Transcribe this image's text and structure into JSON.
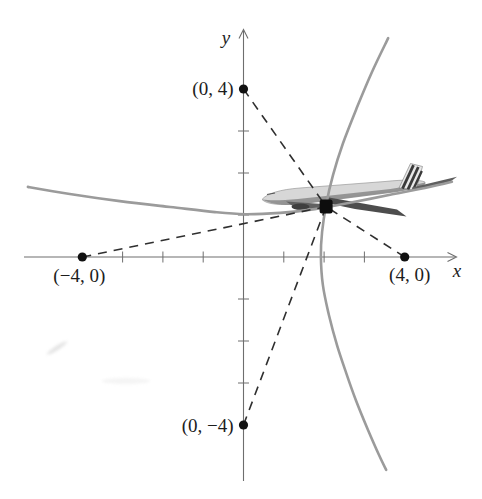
{
  "figure": {
    "background": "#ffffff",
    "text_color": "#1c1c1c",
    "axis_color": "#6e6e6e",
    "curve_color": "#9b9b9b",
    "dash_color": "#2f2f2f",
    "dot_color": "#111111",
    "airplane_grays": [
      "#d7d7d7",
      "#8d8d8d",
      "#4d4d4d",
      "#3a3a3a"
    ]
  },
  "chart_data": {
    "type": "line",
    "title": "",
    "xlabel": "x",
    "ylabel": "y",
    "xlim": [
      -5.4,
      5.3
    ],
    "ylim": [
      -5.35,
      5.4
    ],
    "grid": false,
    "x_ticks": [
      -3,
      -2,
      -1,
      1,
      2,
      3
    ],
    "y_ticks": [
      -3,
      -2,
      -1,
      1,
      2,
      3
    ],
    "foci": [
      {
        "label": "(0, 4)",
        "x": 0,
        "y": 4,
        "anchor": "end",
        "label_offset": [
          -10,
          6
        ]
      },
      {
        "label": "(−4, 0)",
        "x": -4,
        "y": 0,
        "anchor": "middle",
        "label_offset": [
          -3,
          25
        ]
      },
      {
        "label": "(4, 0)",
        "x": 4,
        "y": 0,
        "anchor": "middle",
        "label_offset": [
          5,
          24
        ]
      },
      {
        "label": "(0, −4)",
        "x": 0,
        "y": -4,
        "anchor": "end",
        "label_offset": [
          -10,
          7
        ]
      }
    ],
    "plane_position": {
      "x": 2.05,
      "y": 1.2
    },
    "series": [
      {
        "name": "hyperbola-branch-right (foci on x-axis)",
        "points": [
          [
            3.59,
            5.21
          ],
          [
            3.19,
            4.41
          ],
          [
            2.82,
            3.57
          ],
          [
            2.47,
            2.71
          ],
          [
            2.22,
            1.95
          ],
          [
            2.05,
            1.24
          ],
          [
            1.95,
            0.6
          ],
          [
            1.92,
            0.02
          ],
          [
            1.97,
            -0.67
          ],
          [
            2.12,
            -1.38
          ],
          [
            2.32,
            -2.1
          ],
          [
            2.54,
            -2.74
          ],
          [
            2.79,
            -3.41
          ],
          [
            3.09,
            -4.12
          ],
          [
            3.36,
            -4.71
          ],
          [
            3.54,
            -5.07
          ]
        ]
      },
      {
        "name": "hyperbola-branch-upper (foci on y-axis)",
        "points": [
          [
            -5.35,
            1.67
          ],
          [
            -4.31,
            1.5
          ],
          [
            -3.07,
            1.33
          ],
          [
            -1.82,
            1.19
          ],
          [
            -0.71,
            1.07
          ],
          [
            0.04,
            1.02
          ],
          [
            0.91,
            1.05
          ],
          [
            1.77,
            1.14
          ],
          [
            2.64,
            1.29
          ],
          [
            3.64,
            1.48
          ],
          [
            4.5,
            1.64
          ],
          [
            5.17,
            1.79
          ]
        ]
      }
    ]
  }
}
